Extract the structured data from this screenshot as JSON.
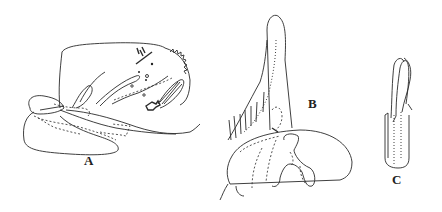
{
  "figure": {
    "panels": [
      {
        "id": "A",
        "label": "A",
        "description": "lateral view of genitalia"
      },
      {
        "id": "B",
        "label": "B",
        "description": "gonostylus and basal plate"
      },
      {
        "id": "C",
        "label": "C",
        "description": "aedeagus tube with filaments"
      }
    ],
    "colors": {
      "ink": "#2a2a2a",
      "background": "#ffffff"
    }
  }
}
